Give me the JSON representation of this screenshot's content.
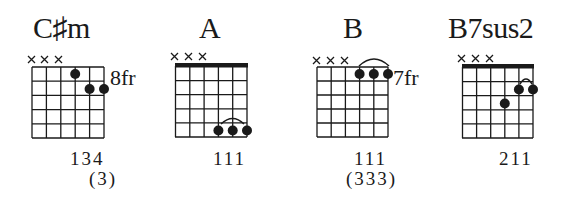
{
  "chords": [
    {
      "name_root": "C",
      "name_accidental": "♯",
      "name_quality": "m",
      "muted_strings": [
        1,
        2,
        3
      ],
      "fret_label": "8fr",
      "nut": false,
      "dots": [
        {
          "string": 4,
          "fret": 1
        },
        {
          "string": 5,
          "fret": 2
        },
        {
          "string": 6,
          "fret": 2
        }
      ],
      "barre": null,
      "fingering": "134",
      "alt_fingering": "(3)"
    },
    {
      "name_root": "A",
      "name_accidental": "",
      "name_quality": "",
      "muted_strings": [
        1,
        2,
        3
      ],
      "fret_label": "",
      "nut": true,
      "dots": [
        {
          "string": 4,
          "fret": 5
        },
        {
          "string": 5,
          "fret": 5
        },
        {
          "string": 6,
          "fret": 5
        }
      ],
      "barre": {
        "from": 4,
        "to": 6,
        "fret": 5
      },
      "fingering": "111",
      "alt_fingering": ""
    },
    {
      "name_root": "B",
      "name_accidental": "",
      "name_quality": "",
      "muted_strings": [
        1,
        2,
        3
      ],
      "fret_label": "7fr",
      "nut": false,
      "dots": [
        {
          "string": 4,
          "fret": 1
        },
        {
          "string": 5,
          "fret": 1
        },
        {
          "string": 6,
          "fret": 1
        }
      ],
      "barre": {
        "from": 4,
        "to": 6,
        "fret": 1
      },
      "fingering": "111",
      "alt_fingering": "(333)"
    },
    {
      "name_root": "B7sus2",
      "name_accidental": "",
      "name_quality": "",
      "muted_strings": [
        1,
        2,
        3
      ],
      "fret_label": "",
      "nut": true,
      "dots": [
        {
          "string": 5,
          "fret": 2
        },
        {
          "string": 6,
          "fret": 2
        },
        {
          "string": 4,
          "fret": 3
        }
      ],
      "barre": {
        "from": 5,
        "to": 6,
        "fret": 2
      },
      "fingering": "211",
      "alt_fingering": ""
    }
  ],
  "style": {
    "ink": "#1a1a1a",
    "background": "#ffffff"
  }
}
